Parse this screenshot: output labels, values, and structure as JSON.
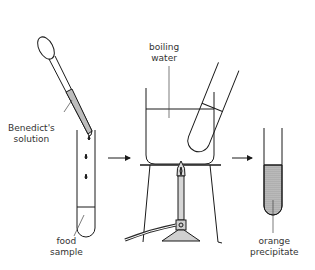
{
  "diagram": {
    "labels": {
      "benedicts_line1": "Benedict's",
      "benedicts_line2": "solution",
      "food_line1": "food",
      "food_line2": "sample",
      "boiling_line1": "boiling",
      "boiling_line2": "water",
      "orange_line1": "orange",
      "orange_line2": "precipitate"
    },
    "steps": [
      "add Benedict's solution to food sample",
      "heat in boiling water bath",
      "orange precipitate forms"
    ],
    "colors": {
      "stroke": "#1a1a1a",
      "solution_fill": "#bdbdbd",
      "precipitate_fill": "#b0b0b0",
      "label_text": "#333333"
    }
  }
}
